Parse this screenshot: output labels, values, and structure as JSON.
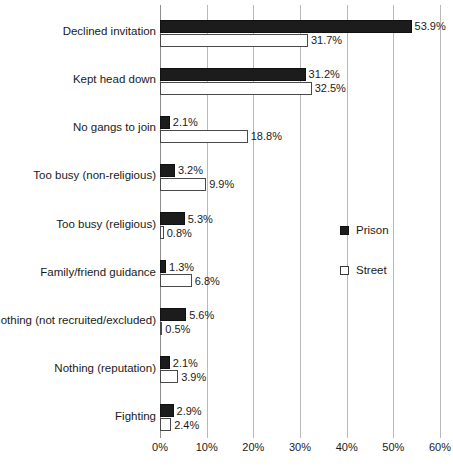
{
  "chart_data": {
    "type": "bar",
    "orientation": "horizontal",
    "title": "",
    "subtitle": "",
    "xlabel": "",
    "ylabel": "",
    "xlim": [
      0,
      60
    ],
    "xticks": [
      "0%",
      "10%",
      "20%",
      "30%",
      "40%",
      "50%",
      "60%"
    ],
    "xtick_values": [
      0,
      10,
      20,
      30,
      40,
      50,
      60
    ],
    "grid": true,
    "legend_position": "right-middle",
    "categories": [
      "Declined invitation",
      "Kept head down",
      "No gangs to join",
      "Too busy (non-religious)",
      "Too busy (religious)",
      "Family/friend guidance",
      "Nothing (not recruited/excluded)",
      "Nothing (reputation)",
      "Fighting"
    ],
    "series": [
      {
        "name": "Prison",
        "color": "#1c1c1c",
        "style": "filled",
        "values": [
          53.9,
          31.2,
          2.1,
          3.2,
          5.3,
          1.3,
          5.6,
          2.1,
          2.9
        ],
        "labels": [
          "53.9%",
          "31.2%",
          "2.1%",
          "3.2%",
          "5.3%",
          "1.3%",
          "5.6%",
          "2.1%",
          "2.9%"
        ]
      },
      {
        "name": "Street",
        "color": "#ffffff",
        "style": "outlined",
        "values": [
          31.7,
          32.5,
          18.8,
          9.9,
          0.8,
          6.8,
          0.5,
          3.9,
          2.4
        ],
        "labels": [
          "31.7%",
          "32.5%",
          "18.8%",
          "9.9%",
          "0.8%",
          "6.8%",
          "0.5%",
          "3.9%",
          "2.4%"
        ]
      }
    ]
  },
  "legend": {
    "items": [
      {
        "label": "Prison",
        "swatch": "filled-square-icon"
      },
      {
        "label": "Street",
        "swatch": "empty-square-icon"
      }
    ]
  }
}
